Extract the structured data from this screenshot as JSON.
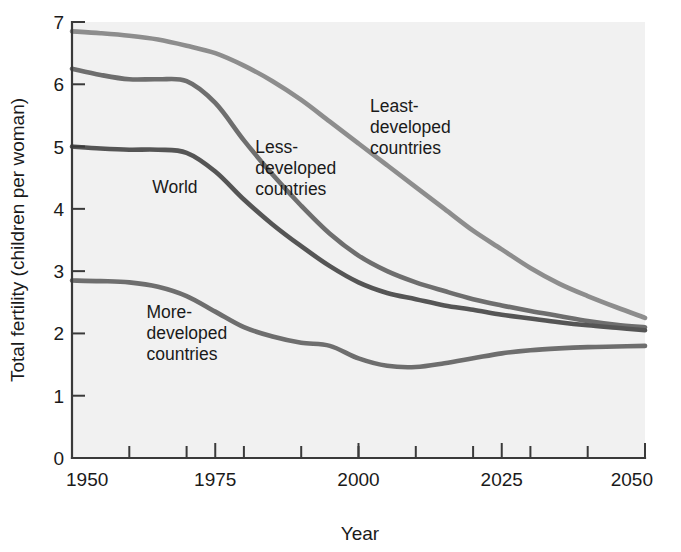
{
  "chart_data": {
    "type": "line",
    "title": "",
    "xlabel": "Year",
    "ylabel": "Total fertility (children per woman)",
    "xlim": [
      1950,
      2050
    ],
    "ylim": [
      0,
      7
    ],
    "grid": false,
    "legend_position": "inline-annotations",
    "xticks": [
      1950,
      1975,
      2000,
      2025,
      2050
    ],
    "xtick_labels": [
      "1950",
      "1975",
      "2000",
      "2025",
      "2050"
    ],
    "xminor_ticks": [
      1960,
      1970,
      1980,
      1990,
      2000,
      2010,
      2020,
      2030,
      2040
    ],
    "yticks": [
      0,
      1,
      2,
      3,
      4,
      5,
      6,
      7
    ],
    "ytick_labels": [
      "0",
      "1",
      "2",
      "3",
      "4",
      "5",
      "6",
      "7"
    ],
    "x": [
      1950,
      1955,
      1960,
      1965,
      1970,
      1975,
      1980,
      1985,
      1990,
      1995,
      2000,
      2005,
      2010,
      2015,
      2020,
      2025,
      2030,
      2035,
      2040,
      2045,
      2050
    ],
    "series": [
      {
        "name": "Least-developed countries",
        "label": "Least-\ndeveloped\ncountries",
        "color": "#8d8d8d",
        "values": [
          6.85,
          6.82,
          6.78,
          6.72,
          6.62,
          6.5,
          6.3,
          6.05,
          5.75,
          5.4,
          5.05,
          4.7,
          4.35,
          4.0,
          3.65,
          3.35,
          3.05,
          2.8,
          2.6,
          2.42,
          2.25
        ]
      },
      {
        "name": "Less-developed countries",
        "label": "Less-\ndeveloped\ncountries",
        "color": "#6e6e6e",
        "values": [
          6.25,
          6.15,
          6.08,
          6.08,
          6.05,
          5.7,
          5.1,
          4.55,
          4.05,
          3.6,
          3.25,
          3.0,
          2.82,
          2.68,
          2.55,
          2.45,
          2.36,
          2.28,
          2.2,
          2.14,
          2.1
        ]
      },
      {
        "name": "World",
        "label": "World",
        "color": "#555555",
        "values": [
          5.0,
          4.97,
          4.95,
          4.95,
          4.9,
          4.6,
          4.15,
          3.75,
          3.4,
          3.08,
          2.82,
          2.65,
          2.55,
          2.45,
          2.38,
          2.3,
          2.24,
          2.18,
          2.13,
          2.09,
          2.05
        ]
      },
      {
        "name": "More-developed countries",
        "label": "More-\ndeveloped\ncountries",
        "color": "#6e6e6e",
        "values": [
          2.85,
          2.84,
          2.82,
          2.75,
          2.6,
          2.35,
          2.1,
          1.95,
          1.85,
          1.8,
          1.6,
          1.48,
          1.46,
          1.52,
          1.6,
          1.68,
          1.73,
          1.76,
          1.78,
          1.79,
          1.8
        ]
      }
    ],
    "annotations": [
      {
        "id": "least-developed",
        "lines": [
          "Least-",
          "developed",
          "countries"
        ],
        "x": 2002,
        "y": 5.55
      },
      {
        "id": "less-developed",
        "lines": [
          "Less-",
          "developed",
          "countries"
        ],
        "x": 1982,
        "y": 4.9
      },
      {
        "id": "world",
        "lines": [
          "World"
        ],
        "x": 1964,
        "y": 4.25
      },
      {
        "id": "more-developed",
        "lines": [
          "More-",
          "developed",
          "countries"
        ],
        "x": 1963,
        "y": 2.25
      }
    ]
  },
  "axes": {
    "y_axis_title": "Total fertility (children per woman)",
    "x_axis_title": "Year"
  }
}
